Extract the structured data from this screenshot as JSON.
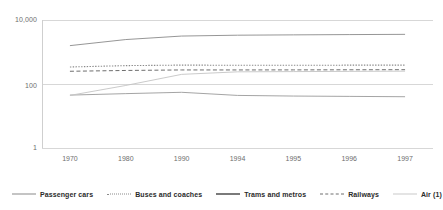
{
  "chart_data": {
    "type": "line",
    "title": "",
    "subtitle": "",
    "xlabel": "",
    "ylabel": "",
    "yscale": "log",
    "ylim": [
      1,
      10000
    ],
    "ytick_labels": [
      "10,000",
      "100",
      "1"
    ],
    "ytick_values": [
      10000,
      100,
      1
    ],
    "grid": true,
    "grid_axis": "y",
    "legend_position": "bottom",
    "categories": [
      "1970",
      "1980",
      "1990",
      "1994",
      "1995",
      "1996",
      "1997"
    ],
    "x": [
      1970,
      1980,
      1990,
      1994,
      1995,
      1996,
      1997
    ],
    "series": [
      {
        "name": "Passenger cars",
        "style": "solid",
        "color": "#8a8a8a",
        "values": [
          1580,
          2450,
          3150,
          3350,
          3430,
          3500,
          3560
        ]
      },
      {
        "name": "Buses and coaches",
        "style": "dotted",
        "color": "#8a8a8a",
        "values": [
          340,
          375,
          390,
          385,
          385,
          388,
          390
        ]
      },
      {
        "name": "Trams and metros",
        "style": "solid",
        "color": "#9a9a9a",
        "values": [
          45,
          50,
          55,
          44,
          42,
          41,
          40
        ]
      },
      {
        "name": "Railways",
        "style": "dashed",
        "color": "#6e6e6e",
        "values": [
          250,
          265,
          275,
          275,
          276,
          278,
          280
        ]
      },
      {
        "name": "Air (1)",
        "style": "solid",
        "color": "#c4c4c4",
        "values": [
          44,
          90,
          200,
          240,
          244,
          248,
          252
        ]
      }
    ]
  },
  "legend": {
    "items": [
      {
        "label": "Passenger cars",
        "style": "solid",
        "color": "#8a8a8a",
        "width": 1
      },
      {
        "label": "Buses and coaches",
        "style": "dotted",
        "color": "#8a8a8a",
        "width": 1
      },
      {
        "label": "Trams and metros",
        "style": "solid",
        "color": "#7a7a7a",
        "width": 2
      },
      {
        "label": "Railways",
        "style": "dashed",
        "color": "#6e6e6e",
        "width": 1
      },
      {
        "label": "Air (1)",
        "style": "solid",
        "color": "#c9c9c9",
        "width": 1
      }
    ]
  },
  "axes": {
    "frame_color": "#cfcfcf",
    "grid_color": "#d7d7d7",
    "tick_label_color": "#6e6e6e"
  }
}
